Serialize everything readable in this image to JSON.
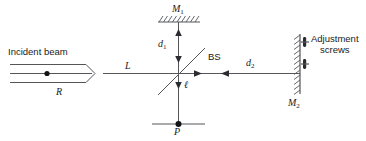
{
  "figure": {
    "stroke_color": "#55565a",
    "text_color": "#1a1a1a",
    "background": "#ffffff",
    "labels": {
      "incident_beam": "Incident beam",
      "beam_radius": "R",
      "path_L": "L",
      "mirror_1": "M",
      "mirror_1_sub": "1",
      "mirror_2": "M",
      "mirror_2_sub": "2",
      "distance_d1": "d",
      "distance_d1_sub": "1",
      "distance_d2": "d",
      "distance_d2_sub": "2",
      "beam_splitter": "BS",
      "small_l": "ℓ",
      "detector_P": "P",
      "adjustment_screws_line1": "Adjustment",
      "adjustment_screws_line2": "screws"
    }
  }
}
